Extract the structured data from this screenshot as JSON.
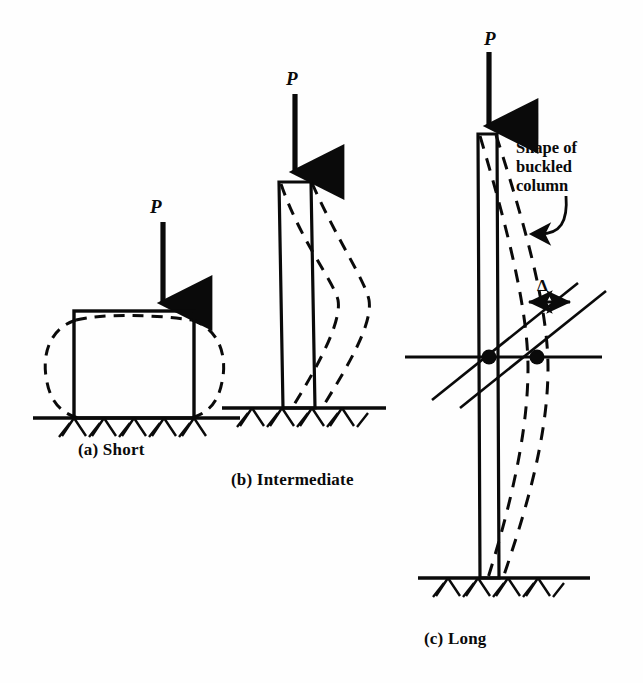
{
  "figure": {
    "background_color": "#fefefe",
    "ink_color": "#0a0a0a",
    "width": 643,
    "height": 683
  },
  "panels": [
    {
      "id": "a",
      "caption": "(a) Short",
      "load_label": "P",
      "mode": "crushing-bulge"
    },
    {
      "id": "b",
      "caption": "(b) Intermediate",
      "load_label": "P",
      "mode": "inelastic-buckling"
    },
    {
      "id": "c",
      "caption": "(c) Long",
      "load_label": "P",
      "mode": "elastic-buckling"
    }
  ],
  "annotations": {
    "buckled_shape": {
      "line1": "Shape of",
      "line2": "buckled",
      "line3": "column"
    },
    "deflection_symbol": "Δ"
  }
}
